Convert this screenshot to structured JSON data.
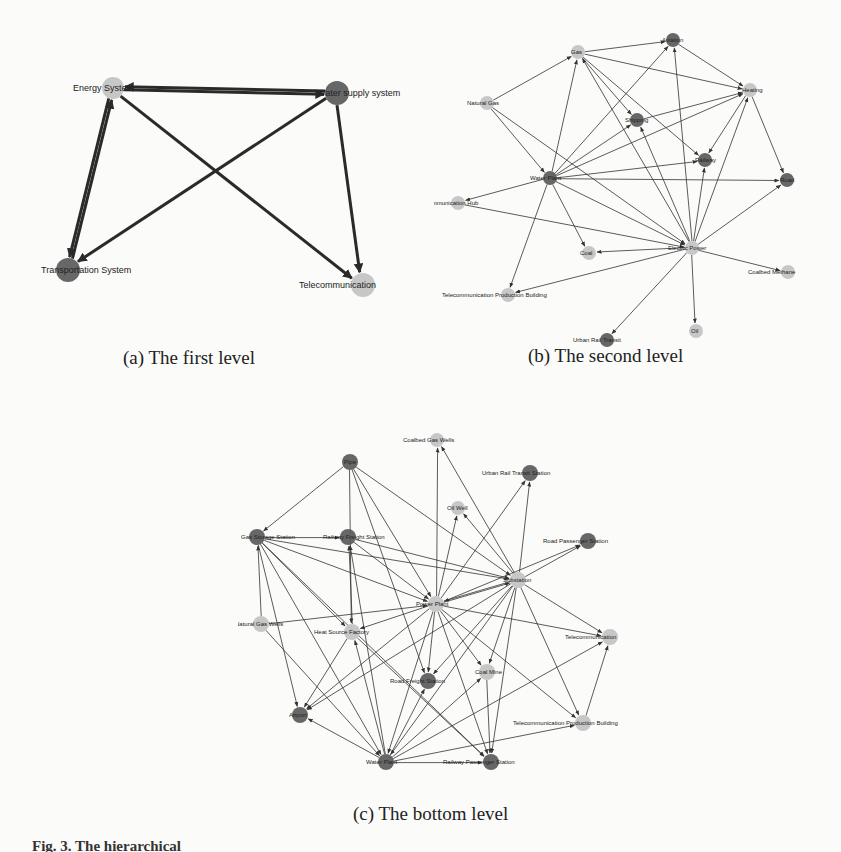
{
  "colors": {
    "dark_node": "#5a5a5a",
    "light_node": "#c2c2c2",
    "edge": "#333333",
    "edge_thick": "#2a2a2a",
    "background": "#fbfbfa"
  },
  "captions": {
    "a": "(a) The first level",
    "b": "(b) The second level",
    "c": "(c) The bottom level",
    "figure": "Fig. 3.  The hierarchical"
  },
  "graphs": [
    {
      "id": "first-level",
      "edge_width": 3,
      "font_size": 9,
      "node_radius": 11,
      "nodes": [
        {
          "id": "energy",
          "label": "Energy System",
          "x": 113,
          "y": 88,
          "shade": "light",
          "r": 11,
          "lx": -40,
          "ly": 3
        },
        {
          "id": "water",
          "label": "Water supply system",
          "x": 337,
          "y": 93,
          "shade": "dark",
          "r": 12,
          "lx": -20,
          "ly": 3
        },
        {
          "id": "transport",
          "label": "Transportation System",
          "x": 68,
          "y": 270,
          "shade": "dark",
          "r": 12,
          "lx": -27,
          "ly": 3,
          "clip_left": 41
        },
        {
          "id": "telecom",
          "label": "Telecommunication",
          "x": 363,
          "y": 285,
          "shade": "light",
          "r": 12,
          "lx": -64,
          "ly": 3
        }
      ],
      "edges": [
        [
          "water",
          "energy"
        ],
        [
          "energy",
          "water"
        ],
        [
          "energy",
          "transport"
        ],
        [
          "transport",
          "energy"
        ],
        [
          "water",
          "transport"
        ],
        [
          "energy",
          "telecom"
        ],
        [
          "water",
          "telecom"
        ]
      ]
    },
    {
      "id": "second-level",
      "edge_width": 1,
      "font_size": 6,
      "node_radius": 7,
      "nodes": [
        {
          "id": "gas",
          "label": "Gas",
          "x": 578,
          "y": 52,
          "shade": "light",
          "r": 7,
          "lx": -7,
          "ly": 2
        },
        {
          "id": "aviation",
          "label": "Aviation",
          "x": 673,
          "y": 40,
          "shade": "dark",
          "r": 7,
          "lx": -11,
          "ly": 2
        },
        {
          "id": "naturalgas",
          "label": "Natural Gas",
          "x": 487,
          "y": 103,
          "shade": "light",
          "r": 7,
          "lx": -20,
          "ly": 2
        },
        {
          "id": "heating",
          "label": "Heating",
          "x": 750,
          "y": 90,
          "shade": "light",
          "r": 7,
          "lx": -8,
          "ly": 2
        },
        {
          "id": "shipping",
          "label": "Shipping",
          "x": 637,
          "y": 120,
          "shade": "dark",
          "r": 7,
          "lx": -12,
          "ly": 2
        },
        {
          "id": "railway",
          "label": "Railway",
          "x": 705,
          "y": 160,
          "shade": "dark",
          "r": 7,
          "lx": -10,
          "ly": 2
        },
        {
          "id": "waterplant",
          "label": "Water Plant",
          "x": 550,
          "y": 178,
          "shade": "dark",
          "r": 7,
          "lx": -20,
          "ly": 2
        },
        {
          "id": "road",
          "label": "Road",
          "x": 787,
          "y": 180,
          "shade": "dark",
          "r": 7,
          "lx": -7,
          "ly": 2
        },
        {
          "id": "commhub",
          "label": "Communication Hub",
          "x": 458,
          "y": 203,
          "shade": "light",
          "r": 7,
          "lx": -34,
          "ly": 2,
          "clip_left": 434
        },
        {
          "id": "electric",
          "label": "Electric Power",
          "x": 692,
          "y": 248,
          "shade": "light",
          "r": 7,
          "lx": -24,
          "ly": 2
        },
        {
          "id": "coal",
          "label": "Coal",
          "x": 589,
          "y": 253,
          "shade": "light",
          "r": 7,
          "lx": -9,
          "ly": 2
        },
        {
          "id": "coalbed",
          "label": "Coalbed Methane",
          "x": 788,
          "y": 272,
          "shade": "light",
          "r": 7,
          "lx": -40,
          "ly": 2
        },
        {
          "id": "telprod",
          "label": "Telecommunication Production Building",
          "x": 508,
          "y": 295,
          "shade": "light",
          "r": 7,
          "lx": -66,
          "ly": 2
        },
        {
          "id": "oil",
          "label": "Oil",
          "x": 696,
          "y": 331,
          "shade": "light",
          "r": 7,
          "lx": -5,
          "ly": 2
        },
        {
          "id": "urbanrail",
          "label": "Urban Rail Transit",
          "x": 607,
          "y": 340,
          "shade": "dark",
          "r": 7,
          "lx": -34,
          "ly": 2
        }
      ],
      "edges": [
        [
          "naturalgas",
          "gas"
        ],
        [
          "gas",
          "aviation"
        ],
        [
          "gas",
          "heating"
        ],
        [
          "aviation",
          "heating"
        ],
        [
          "waterplant",
          "gas"
        ],
        [
          "waterplant",
          "aviation"
        ],
        [
          "waterplant",
          "heating"
        ],
        [
          "waterplant",
          "shipping"
        ],
        [
          "waterplant",
          "railway"
        ],
        [
          "waterplant",
          "road"
        ],
        [
          "waterplant",
          "commhub"
        ],
        [
          "waterplant",
          "coal"
        ],
        [
          "waterplant",
          "telprod"
        ],
        [
          "waterplant",
          "electric"
        ],
        [
          "naturalgas",
          "waterplant"
        ],
        [
          "naturalgas",
          "electric"
        ],
        [
          "electric",
          "gas"
        ],
        [
          "electric",
          "aviation"
        ],
        [
          "electric",
          "heating"
        ],
        [
          "electric",
          "shipping"
        ],
        [
          "electric",
          "railway"
        ],
        [
          "electric",
          "road"
        ],
        [
          "electric",
          "coal"
        ],
        [
          "electric",
          "coalbed"
        ],
        [
          "electric",
          "oil"
        ],
        [
          "electric",
          "urbanrail"
        ],
        [
          "electric",
          "telprod"
        ],
        [
          "commhub",
          "electric"
        ],
        [
          "heating",
          "railway"
        ],
        [
          "heating",
          "road"
        ],
        [
          "gas",
          "shipping"
        ],
        [
          "gas",
          "railway"
        ],
        [
          "shipping",
          "heating"
        ]
      ]
    },
    {
      "id": "bottom-level",
      "edge_width": 1,
      "font_size": 6,
      "node_radius": 8,
      "nodes": [
        {
          "id": "cbwells",
          "label": "Coalbed Gas Wells",
          "x": 437,
          "y": 440,
          "shade": "light",
          "r": 7,
          "lx": -34,
          "ly": 2
        },
        {
          "id": "pipe",
          "label": "Pipe",
          "x": 350,
          "y": 462,
          "shade": "dark",
          "r": 8,
          "lx": -6,
          "ly": 2
        },
        {
          "id": "urst",
          "label": "Urban Rail Transit Station",
          "x": 530,
          "y": 473,
          "shade": "dark",
          "r": 8,
          "lx": -48,
          "ly": 2
        },
        {
          "id": "oilwell",
          "label": "Oil Well",
          "x": 458,
          "y": 508,
          "shade": "light",
          "r": 7,
          "lx": -11,
          "ly": 2
        },
        {
          "id": "gasstor",
          "label": "Gas Storage Station",
          "x": 257,
          "y": 537,
          "shade": "dark",
          "r": 8,
          "lx": -16,
          "ly": 2,
          "clip_left": 240
        },
        {
          "id": "railfr",
          "label": "Railway Freight Station",
          "x": 348,
          "y": 537,
          "shade": "dark",
          "r": 8,
          "lx": -25,
          "ly": 2
        },
        {
          "id": "roadpass",
          "label": "Road Passenger Station",
          "x": 588,
          "y": 541,
          "shade": "dark",
          "r": 8,
          "lx": -45,
          "ly": 2
        },
        {
          "id": "substation",
          "label": "Substation",
          "x": 518,
          "y": 580,
          "shade": "light",
          "r": 8,
          "lx": -15,
          "ly": 2
        },
        {
          "id": "powerplant",
          "label": "Power Plant",
          "x": 436,
          "y": 604,
          "shade": "light",
          "r": 8,
          "lx": -20,
          "ly": 2
        },
        {
          "id": "ngwells",
          "label": "Natural Gas Wells",
          "x": 261,
          "y": 624,
          "shade": "light",
          "r": 8,
          "lx": -26,
          "ly": 2,
          "clip_left": 238
        },
        {
          "id": "heatsrc",
          "label": "Heat Source Factory",
          "x": 352,
          "y": 632,
          "shade": "light",
          "r": 8,
          "lx": -38,
          "ly": 2
        },
        {
          "id": "telecom",
          "label": "Telecommunication",
          "x": 610,
          "y": 637,
          "shade": "light",
          "r": 8,
          "lx": -45,
          "ly": 2,
          "clip_right": 628
        },
        {
          "id": "coalmine",
          "label": "Coal Mine",
          "x": 487,
          "y": 672,
          "shade": "light",
          "r": 8,
          "lx": -12,
          "ly": 2
        },
        {
          "id": "roadfr",
          "label": "Road Freight Station",
          "x": 428,
          "y": 681,
          "shade": "dark",
          "r": 8,
          "lx": -38,
          "ly": 2
        },
        {
          "id": "airport",
          "label": "Airport",
          "x": 300,
          "y": 715,
          "shade": "dark",
          "r": 8,
          "lx": -11,
          "ly": 2
        },
        {
          "id": "telprod",
          "label": "Telecommunication Production Building",
          "x": 583,
          "y": 723,
          "shade": "light",
          "r": 8,
          "lx": -70,
          "ly": 2,
          "clip_right": 634
        },
        {
          "id": "waterplant",
          "label": "Water Plant",
          "x": 386,
          "y": 762,
          "shade": "dark",
          "r": 8,
          "lx": -20,
          "ly": 2
        },
        {
          "id": "railpass",
          "label": "Railway Passenger Station",
          "x": 491,
          "y": 762,
          "shade": "dark",
          "r": 8,
          "lx": -48,
          "ly": 2
        }
      ],
      "edges": [
        [
          "pipe",
          "gasstor"
        ],
        [
          "pipe",
          "heatsrc"
        ],
        [
          "pipe",
          "powerplant"
        ],
        [
          "pipe",
          "substation"
        ],
        [
          "pipe",
          "roadfr"
        ],
        [
          "powerplant",
          "cbwells"
        ],
        [
          "substation",
          "cbwells"
        ],
        [
          "substation",
          "urst"
        ],
        [
          "powerplant",
          "urst"
        ],
        [
          "powerplant",
          "oilwell"
        ],
        [
          "substation",
          "oilwell"
        ],
        [
          "gasstor",
          "railfr"
        ],
        [
          "gasstor",
          "powerplant"
        ],
        [
          "gasstor",
          "substation"
        ],
        [
          "gasstor",
          "heatsrc"
        ],
        [
          "gasstor",
          "airport"
        ],
        [
          "gasstor",
          "waterplant"
        ],
        [
          "gasstor",
          "railpass"
        ],
        [
          "ngwells",
          "gasstor"
        ],
        [
          "ngwells",
          "powerplant"
        ],
        [
          "ngwells",
          "waterplant"
        ],
        [
          "railfr",
          "powerplant"
        ],
        [
          "railfr",
          "substation"
        ],
        [
          "heatsrc",
          "railfr"
        ],
        [
          "waterplant",
          "railfr"
        ],
        [
          "powerplant",
          "roadpass"
        ],
        [
          "substation",
          "roadpass"
        ],
        [
          "powerplant",
          "substation"
        ],
        [
          "substation",
          "powerplant"
        ],
        [
          "powerplant",
          "heatsrc"
        ],
        [
          "powerplant",
          "telecom"
        ],
        [
          "substation",
          "telecom"
        ],
        [
          "powerplant",
          "coalmine"
        ],
        [
          "substation",
          "coalmine"
        ],
        [
          "powerplant",
          "roadfr"
        ],
        [
          "substation",
          "roadfr"
        ],
        [
          "powerplant",
          "airport"
        ],
        [
          "substation",
          "airport"
        ],
        [
          "powerplant",
          "telprod"
        ],
        [
          "substation",
          "telprod"
        ],
        [
          "powerplant",
          "waterplant"
        ],
        [
          "substation",
          "waterplant"
        ],
        [
          "powerplant",
          "railpass"
        ],
        [
          "substation",
          "railpass"
        ],
        [
          "heatsrc",
          "airport"
        ],
        [
          "waterplant",
          "heatsrc"
        ],
        [
          "heatsrc",
          "railpass"
        ],
        [
          "waterplant",
          "airport"
        ],
        [
          "waterplant",
          "roadfr"
        ],
        [
          "waterplant",
          "telecom"
        ],
        [
          "waterplant",
          "telprod"
        ],
        [
          "waterplant",
          "railpass"
        ],
        [
          "telprod",
          "telecom"
        ],
        [
          "coalmine",
          "railpass"
        ],
        [
          "waterplant",
          "coalmine"
        ]
      ]
    }
  ]
}
